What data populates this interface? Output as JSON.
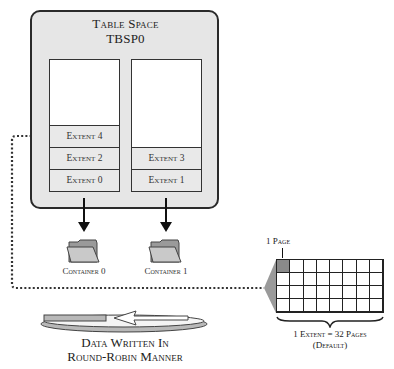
{
  "tablespace": {
    "title_line1": "Table Space",
    "title_line2": "TBSP0"
  },
  "containers": [
    {
      "label": "Container 0",
      "extents": [
        "Extent 4",
        "Extent 2",
        "Extent 0"
      ]
    },
    {
      "label": "Container 1",
      "extents": [
        "Extent 3",
        "Extent 1"
      ]
    }
  ],
  "extent_detail": {
    "page_label": "1 Page",
    "rows": 4,
    "columns": 8,
    "size_label": "1 Extent = 32 Pages",
    "default_label": "(Default)"
  },
  "round_robin": {
    "line1": "Data Written In",
    "line2": "Round-Robin Manner"
  },
  "icons": {
    "container": "folder-icon",
    "arrow": "arrow-down-icon",
    "cycle": "round-robin-cycle-icon",
    "brace": "curly-brace-icon"
  },
  "colors": {
    "tablespace_fill": "#e6e6e6",
    "extent_fill": "#e9e9e9",
    "highlighted_page": "#8a8a8a",
    "border": "#2a2a2a"
  }
}
